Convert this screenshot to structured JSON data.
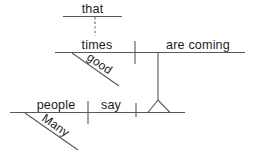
{
  "diagram": {
    "type": "reed-kellogg-sentence-diagram",
    "sentence": "Many people say that good times are coming.",
    "canvas": {
      "width": 255,
      "height": 156,
      "background": "#ffffff"
    },
    "colors": {
      "line": "#58585a",
      "text": "#1d1d1f",
      "dashed_line": "#6d6d6f"
    },
    "clauses": {
      "subordinate_top": {
        "name": "that-clause-marker",
        "baseline": {
          "x1": 63,
          "y1": 16.5,
          "x2": 122,
          "y2": 16.5
        },
        "word": {
          "label": "that",
          "x": 92.5,
          "y": 13.0,
          "anchor": "middle"
        },
        "connector": {
          "name": "dashed-connector",
          "x1": 95,
          "y1": 17,
          "x2": 95,
          "y2": 36,
          "style": "dashed"
        }
      },
      "main_clause": {
        "name": "noun-clause-baseline",
        "baseline": {
          "x1": 55,
          "y1": 52.5,
          "x2": 245,
          "y2": 52.5
        },
        "subject": {
          "label": "times",
          "x": 97,
          "y": 48.5,
          "anchor": "middle"
        },
        "predicate": {
          "label": "are coming",
          "x": 198,
          "y": 48.5,
          "anchor": "middle"
        },
        "divider": {
          "name": "subject-predicate-divider",
          "x1": 135,
          "y1": 41,
          "x2": 135,
          "y2": 64
        },
        "modifier": {
          "label": "good",
          "name": "adjective-modifier-good",
          "line": {
            "x1": 72,
            "y1": 53,
            "x2": 119,
            "y2": 86
          },
          "text_x": 86,
          "text_y": 59,
          "rotation": 35
        }
      },
      "matrix_clause": {
        "name": "main-clause-baseline",
        "baseline": {
          "x1": 10,
          "y1": 112.5,
          "x2": 185,
          "y2": 112.5
        },
        "subject": {
          "label": "people",
          "x": 56,
          "y": 108.5,
          "anchor": "middle"
        },
        "verb": {
          "label": "say",
          "x": 111,
          "y": 108.5,
          "anchor": "middle"
        },
        "subject_verb_divider": {
          "name": "subject-verb-divider",
          "x1": 88,
          "y1": 101,
          "x2": 88,
          "y2": 124
        },
        "object_divider": {
          "name": "verb-object-divider",
          "x1": 136,
          "y1": 103,
          "x2": 136,
          "y2": 117
        },
        "modifier": {
          "label": "Many",
          "name": "adjective-modifier-many",
          "line": {
            "x1": 25,
            "y1": 113,
            "x2": 78,
            "y2": 150
          },
          "text_x": 41,
          "text_y": 120,
          "rotation": 35
        }
      }
    },
    "connectors": {
      "object_stem": {
        "name": "noun-clause-object-stem",
        "x1": 158,
        "y1": 53,
        "x2": 158,
        "y2": 100
      },
      "object_tripod": {
        "name": "noun-clause-tripod",
        "apex_x": 158,
        "apex_y": 100,
        "left_x": 148,
        "right_x": 170,
        "base_y": 112.5
      }
    }
  }
}
